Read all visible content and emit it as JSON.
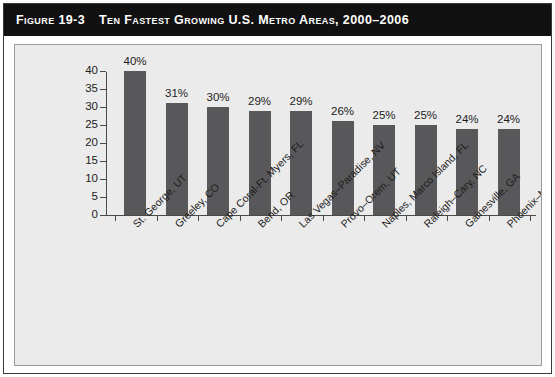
{
  "figure": {
    "number_label": "Figure 19-3",
    "caption": "Ten Fastest Growing U.S. Metro Areas, 2000–2006"
  },
  "colors": {
    "banner_background": "#111111",
    "banner_text": "#ffffff",
    "plot_background": "#ebebeb",
    "bar_fill": "#58585a",
    "axis": "#4a4a4a",
    "frame": "#3a3a3a"
  },
  "chart_data": {
    "type": "bar",
    "title": "Ten Fastest Growing U.S. Metro Areas, 2000–2006",
    "xlabel": "",
    "ylabel": "",
    "ylim": [
      0,
      40
    ],
    "ytick_labels": [
      "0",
      "5",
      "10",
      "15",
      "20",
      "25",
      "30",
      "35",
      "40"
    ],
    "ytick_values": [
      0,
      5,
      10,
      15,
      20,
      25,
      30,
      35,
      40
    ],
    "grid": false,
    "legend": "none",
    "categories": [
      "St. George, UT",
      "Greeley, CO",
      "Cape Coral-Ft. Myers, FL",
      "Bend, OR",
      "Las Vegas–Paradise, NV",
      "Provo–Orem, UT",
      "Naples, Marco Island, FL",
      "Raleigh–Cary, NC",
      "Gainesville, GA",
      "Phoenix–Mesa–Scottsdale, AZ"
    ],
    "values": [
      40,
      31,
      30,
      29,
      29,
      26,
      25,
      25,
      24,
      24
    ],
    "value_labels": [
      "40%",
      "31%",
      "30%",
      "29%",
      "29%",
      "26%",
      "25%",
      "25%",
      "24%",
      "24%"
    ]
  }
}
